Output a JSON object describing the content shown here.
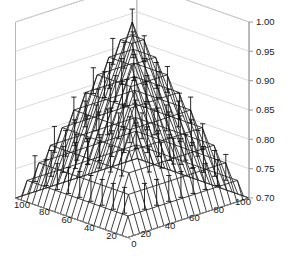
{
  "chart_data": {
    "type": "surface",
    "title": "",
    "xlabel": "",
    "ylabel": "",
    "zlabel": "",
    "grid": true,
    "legend": null,
    "projection": "3d-mesh-with-errorbars",
    "axes": {
      "x": {
        "label": "",
        "range": [
          0,
          100
        ],
        "ticks": [
          0,
          20,
          40,
          60,
          80,
          100
        ],
        "tick_labels": [
          "0",
          "20",
          "40",
          "60",
          "80",
          "100"
        ],
        "direction": "right-to-left along front-right edge"
      },
      "y": {
        "label": "",
        "range": [
          0,
          100
        ],
        "ticks": [
          20,
          40,
          60,
          80,
          100
        ],
        "tick_labels": [
          "20",
          "40",
          "60",
          "80",
          "100"
        ],
        "direction": "descending along front-left edge"
      },
      "z": {
        "label": "",
        "range": [
          0.7,
          1.0
        ],
        "ticks": [
          0.7,
          0.75,
          0.8,
          0.85,
          0.9,
          0.95,
          1.0
        ],
        "tick_labels": [
          "0.70",
          "0.75",
          "0.80",
          "0.85",
          "0.90",
          "0.95",
          "1.00"
        ]
      }
    },
    "x": [
      0,
      5,
      10,
      15,
      20,
      25,
      30,
      35,
      40,
      45,
      50,
      55,
      60,
      65,
      70,
      75,
      80,
      85,
      90,
      95,
      100
    ],
    "y": [
      0,
      5,
      10,
      15,
      20,
      25,
      30,
      35,
      40,
      45,
      50,
      55,
      60,
      65,
      70,
      75,
      80,
      85,
      90,
      95,
      100
    ],
    "z_peak": 1.0,
    "z_corner_min": 0.7,
    "z_model": "z = 0.70 + 0.30 * (1 - max(|2x/100-1|, |2y/100-1|)) approximated as a pyramid peaking at the center",
    "contour_rows_z": [
      0.75,
      0.8,
      0.85,
      0.9,
      0.95,
      1.0
    ],
    "errorbar_half_length_z": 0.022,
    "series": [
      {
        "name": "surface",
        "color": "#000000",
        "style": "wireframe-mesh"
      },
      {
        "name": "errorbars",
        "color": "#1a1a1a",
        "style": "vertical-capped-bars"
      }
    ]
  },
  "colors": {
    "background": "#ffffff",
    "mesh": "#1c1c1c",
    "errorbar": "#111111",
    "axis_line": "#9a9a9a",
    "grid_line": "#d0d0d0",
    "tick_text": "#1a1a1a",
    "floor_line": "#8a8a8a"
  },
  "axis_tick_labels": {
    "z": [
      "1.00",
      "0.95",
      "0.90",
      "0.85",
      "0.80",
      "0.75",
      "0.70"
    ],
    "y_left": [
      "100",
      "80",
      "60",
      "40",
      "20"
    ],
    "x_front": [
      "0",
      "20",
      "40",
      "60",
      "80",
      "100"
    ]
  }
}
